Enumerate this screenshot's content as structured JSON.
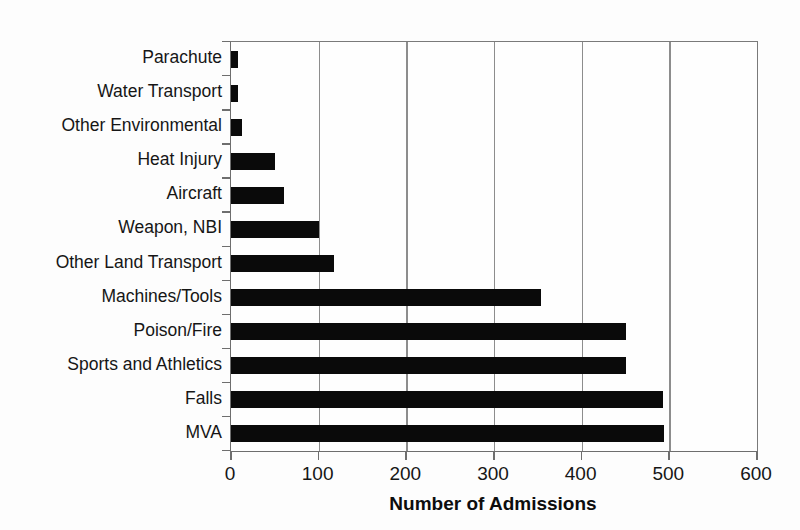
{
  "chart_data": {
    "type": "bar",
    "orientation": "horizontal",
    "title": "",
    "xlabel": "Number of Admissions",
    "ylabel": "",
    "xlim": [
      0,
      600
    ],
    "xticks": [
      0,
      100,
      200,
      300,
      400,
      500,
      600
    ],
    "xtick_labels": [
      "0",
      "100",
      "200",
      "300",
      "400",
      "500",
      "600"
    ],
    "grid": "vertical gridlines at each 100 unit tick",
    "legend": "none",
    "bar_color": "#0a0a0a",
    "categories": [
      "Parachute",
      "Water Transport",
      "Other Environmental",
      "Heat Injury",
      "Aircraft",
      "Weapon, NBI",
      "Other Land Transport",
      "Machines/Tools",
      "Poison/Fire",
      "Sports and Athletics",
      "Falls",
      "MVA"
    ],
    "values": [
      8,
      8,
      13,
      50,
      60,
      100,
      118,
      354,
      450,
      450,
      493,
      494
    ]
  },
  "axis": {
    "x_title": "Number of Admissions"
  }
}
